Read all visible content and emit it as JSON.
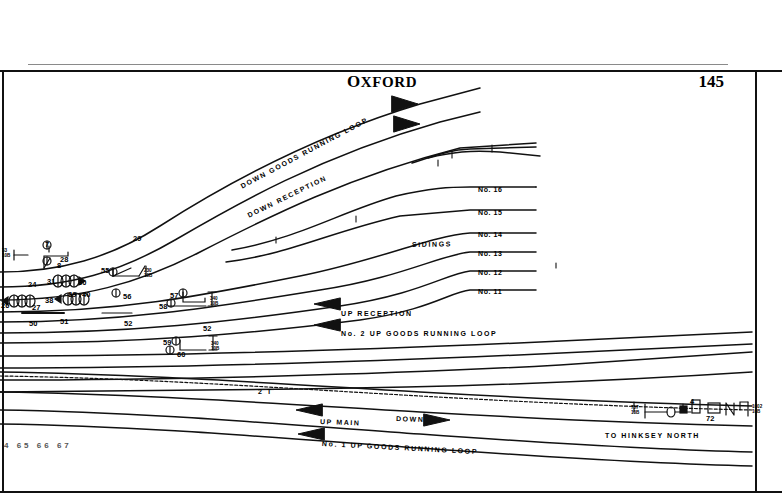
{
  "header": {
    "title_first": "O",
    "title_rest": "XFORD",
    "title_full": "OXFORD",
    "page_number": "145"
  },
  "diagram": {
    "name": "oxford-signalling-track-diagram",
    "track_labels": [
      {
        "id": "down-goods-running-loop",
        "text": "DOWN  GOODS  RUNNING  LOOP",
        "x": 241,
        "y": 183,
        "rotate": -28
      },
      {
        "id": "down-reception",
        "text": "DOWN   RECEPTION",
        "x": 248,
        "y": 212,
        "rotate": -26
      },
      {
        "id": "sidings",
        "text": "SIDINGS",
        "x": 412,
        "y": 241,
        "rotate": -1
      },
      {
        "id": "up-reception",
        "text": "UP   RECEPTION",
        "x": 341,
        "y": 310,
        "rotate": 0
      },
      {
        "id": "no2-up-goods-running-loop",
        "text": "No. 2   UP   GOODS   RUNNING   LOOP",
        "x": 341,
        "y": 330,
        "rotate": 0
      },
      {
        "id": "up-main",
        "text": "UP   MAIN",
        "x": 320,
        "y": 418,
        "rotate": 2
      },
      {
        "id": "down",
        "text": "DOWN",
        "x": 396,
        "y": 415,
        "rotate": 2
      },
      {
        "id": "no1-up-goods-running-loop",
        "text": "No. 1   UP   GOODS   RUNNING   LOOP",
        "x": 322,
        "y": 440,
        "rotate": 3
      },
      {
        "id": "to-hinksey-north",
        "text": "TO  HINKSEY   NORTH",
        "x": 605,
        "y": 432,
        "rotate": 0
      },
      {
        "id": "two-t",
        "text": "2 T",
        "x": 258,
        "y": 388,
        "rotate": 0
      }
    ],
    "siding_numbers": [
      {
        "label": "No. 16",
        "x": 478,
        "y": 186
      },
      {
        "label": "No. 15",
        "x": 478,
        "y": 209
      },
      {
        "label": "No. 14",
        "x": 478,
        "y": 231
      },
      {
        "label": "No. 13",
        "x": 478,
        "y": 250
      },
      {
        "label": "No. 12",
        "x": 478,
        "y": 269
      },
      {
        "label": "No. 11",
        "x": 478,
        "y": 288
      }
    ],
    "point_numbers": [
      {
        "label": "7",
        "x": 45,
        "y": 240
      },
      {
        "label": "8",
        "x": 57,
        "y": 261
      },
      {
        "label": "28",
        "x": 60,
        "y": 255
      },
      {
        "label": "29",
        "x": 133,
        "y": 234
      },
      {
        "label": "24",
        "x": 28,
        "y": 280
      },
      {
        "label": "31",
        "x": 47,
        "y": 277
      },
      {
        "label": "30",
        "x": 78,
        "y": 278
      },
      {
        "label": "38",
        "x": 45,
        "y": 296
      },
      {
        "label": "39",
        "x": 68,
        "y": 290
      },
      {
        "label": "40",
        "x": 82,
        "y": 290
      },
      {
        "label": "26",
        "x": 1,
        "y": 301
      },
      {
        "label": "27",
        "x": 32,
        "y": 303
      },
      {
        "label": "50",
        "x": 29,
        "y": 319
      },
      {
        "label": "51",
        "x": 60,
        "y": 317
      },
      {
        "label": "52",
        "x": 124,
        "y": 319
      },
      {
        "label": "52",
        "x": 203,
        "y": 324
      },
      {
        "label": "55",
        "x": 101,
        "y": 266
      },
      {
        "label": "56",
        "x": 123,
        "y": 292
      },
      {
        "label": "57",
        "x": 170,
        "y": 291
      },
      {
        "label": "58",
        "x": 159,
        "y": 302
      },
      {
        "label": "59",
        "x": 163,
        "y": 338
      },
      {
        "label": "60",
        "x": 177,
        "y": 350
      },
      {
        "label": "72",
        "x": 706,
        "y": 414
      },
      {
        "label": "4",
        "x": 690,
        "y": 397
      }
    ],
    "markers": [
      {
        "top": "33",
        "bottom": "10B",
        "x": 2,
        "y": 248
      },
      {
        "top": "230",
        "bottom": "10B",
        "x": 144,
        "y": 268
      },
      {
        "top": "340",
        "bottom": "10B",
        "x": 210,
        "y": 296
      },
      {
        "top": "340",
        "bottom": "10B",
        "x": 211,
        "y": 341
      },
      {
        "top": "757",
        "bottom": "10B",
        "x": 631,
        "y": 405
      },
      {
        "top": "1002",
        "bottom": "10B",
        "x": 752,
        "y": 404
      }
    ],
    "bottom_numbers": "4  65  66  67",
    "mile_post_letter": "M",
    "signal_letter": "W"
  },
  "colors": {
    "ink": "#111111",
    "rule": "#8a8a8a",
    "faint": "#555555"
  }
}
